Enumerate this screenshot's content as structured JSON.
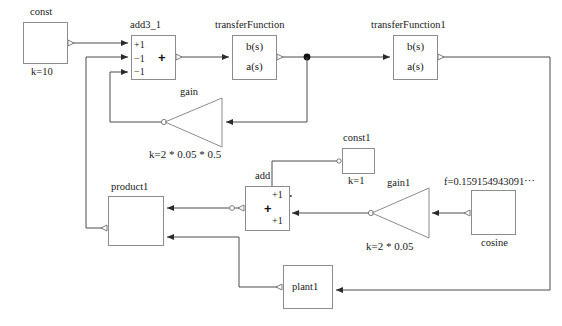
{
  "diagram": {
    "colors": {
      "wire": "#4d4d4d",
      "block_border": "#8c8c8c",
      "text": "#1a1a1a",
      "background": "#ffffff",
      "signal_curve": "#9a9a9a"
    },
    "blocks": [
      {
        "id": "const",
        "name": "const",
        "label": "const",
        "param": "k=10",
        "kind": "constant-source",
        "x": 23,
        "y": 22,
        "w": 45,
        "h": 42
      },
      {
        "id": "add3_1",
        "name": "add3_1",
        "label": "add3_1",
        "kind": "adder3",
        "ports": [
          "+1",
          "−1",
          "−1"
        ],
        "symbol": "+",
        "x": 131,
        "y": 35,
        "w": 45,
        "h": 45
      },
      {
        "id": "transferFunction",
        "name": "transferFunction",
        "label": "transferFunction",
        "kind": "transfer-function",
        "numerator": "b(s)",
        "denominator": "a(s)",
        "x": 232,
        "y": 35,
        "w": 45,
        "h": 45
      },
      {
        "id": "transferFunction1",
        "name": "transferFunction1",
        "label": "transferFunction1",
        "kind": "transfer-function",
        "numerator": "b(s)",
        "denominator": "a(s)",
        "x": 393,
        "y": 35,
        "w": 45,
        "h": 45
      },
      {
        "id": "gain",
        "name": "gain",
        "label": "gain",
        "param": "k=2 * 0.05 * 0.5",
        "kind": "gain-triangle",
        "direction": "left",
        "x": 166,
        "y": 98,
        "w": 56,
        "h": 50
      },
      {
        "id": "const1",
        "name": "const1",
        "label": "const1",
        "param": "k=1",
        "kind": "constant-source",
        "x": 342,
        "y": 148,
        "w": 33,
        "h": 26
      },
      {
        "id": "add",
        "name": "add",
        "label": "add",
        "kind": "adder2",
        "ports": [
          "+1",
          "+1"
        ],
        "symbol": "+",
        "x": 245,
        "y": 186,
        "w": 45,
        "h": 45
      },
      {
        "id": "gain1",
        "name": "gain1",
        "label": "gain1",
        "param": "k=2 * 0.05",
        "kind": "gain-triangle",
        "direction": "left",
        "x": 373,
        "y": 188,
        "w": 56,
        "h": 50
      },
      {
        "id": "cosine",
        "name": "cosine",
        "label": "cosine",
        "param": "f=0.159154943091⋯",
        "kind": "cosine-source",
        "x": 471,
        "y": 190,
        "w": 45,
        "h": 45
      },
      {
        "id": "product1",
        "name": "product1",
        "label": "product1",
        "kind": "product",
        "symbol": "×",
        "x": 108,
        "y": 196,
        "w": 56,
        "h": 50
      },
      {
        "id": "plant1",
        "name": "plant1",
        "label": "plant1",
        "kind": "subsystem",
        "x": 283,
        "y": 265,
        "w": 50,
        "h": 44
      }
    ],
    "connections": [
      {
        "from": "const",
        "to": "add3_1.in1"
      },
      {
        "from": "add3_1.out",
        "to": "transferFunction.in"
      },
      {
        "from": "transferFunction.out",
        "to": "transferFunction1.in",
        "junction": true
      },
      {
        "from": "transferFunction.out",
        "to": "gain.in"
      },
      {
        "from": "gain.out",
        "to": "add3_1.in3"
      },
      {
        "from": "transferFunction1.out",
        "to": "plant1.in"
      },
      {
        "from": "product1.out",
        "to": "add3_1.in2"
      },
      {
        "from": "add.out",
        "to": "product1.in1"
      },
      {
        "from": "const1.out",
        "to": "add.in1"
      },
      {
        "from": "gain1.out",
        "to": "add.in2"
      },
      {
        "from": "cosine.out",
        "to": "gain1.in"
      },
      {
        "from": "plant1.out",
        "to": "product1.in2"
      }
    ]
  }
}
